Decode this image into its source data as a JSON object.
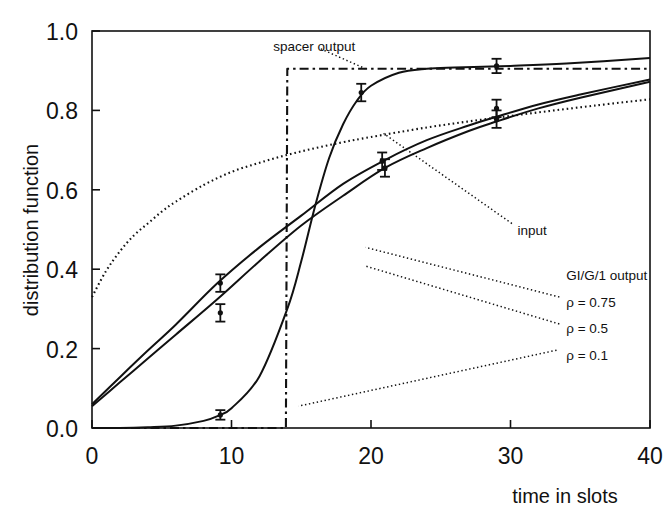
{
  "chart_data": {
    "type": "line",
    "title": "",
    "xlabel": "time in slots",
    "ylabel": "distribution function",
    "xlim": [
      0,
      40
    ],
    "ylim": [
      0.0,
      1.0
    ],
    "xticks": [
      0,
      10,
      20,
      30,
      40
    ],
    "xtick_labels": [
      "0",
      "10",
      "20",
      "30",
      "40"
    ],
    "yticks": [
      0.0,
      0.2,
      0.4,
      0.6,
      0.8,
      1.0
    ],
    "ytick_labels": [
      "0.0",
      "0.2",
      "0.4",
      "0.6",
      "0.8",
      "1.0"
    ],
    "grid": false,
    "legend_position": "inside-annotations",
    "series": [
      {
        "name": "input",
        "style": "dotted",
        "annotation": "input",
        "x": [
          0,
          1,
          2,
          3,
          4,
          5,
          6,
          8,
          10,
          12,
          14,
          16,
          18,
          20,
          24,
          28,
          32,
          36,
          40
        ],
        "y": [
          0.33,
          0.395,
          0.445,
          0.485,
          0.515,
          0.545,
          0.57,
          0.612,
          0.645,
          0.668,
          0.688,
          0.705,
          0.72,
          0.733,
          0.757,
          0.777,
          0.795,
          0.812,
          0.828
        ]
      },
      {
        "name": "spacer output",
        "style": "dash-dot",
        "annotation": "spacer output",
        "x": [
          0,
          13.9,
          14.0,
          14.1,
          40
        ],
        "y": [
          0.0,
          0.0,
          0.905,
          0.905,
          0.905
        ]
      },
      {
        "name": "GI/G/1 output rho = 0.1",
        "label": "ρ = 0.1",
        "style": "solid",
        "x": [
          0,
          2,
          4,
          6,
          8,
          9,
          10,
          12,
          14,
          15,
          16,
          17,
          18,
          19,
          20,
          22,
          24,
          26,
          28,
          30,
          34,
          40
        ],
        "y": [
          0.0,
          0.0,
          0.002,
          0.006,
          0.018,
          0.03,
          0.05,
          0.13,
          0.3,
          0.42,
          0.56,
          0.68,
          0.765,
          0.825,
          0.862,
          0.895,
          0.905,
          0.908,
          0.91,
          0.912,
          0.918,
          0.932
        ]
      },
      {
        "name": "GI/G/1 output rho = 0.5",
        "label": "ρ = 0.5",
        "style": "solid",
        "x": [
          0,
          2,
          4,
          6,
          9,
          12,
          15,
          18,
          21,
          24,
          27,
          29,
          32,
          35,
          40
        ],
        "y": [
          0.055,
          0.115,
          0.175,
          0.235,
          0.325,
          0.42,
          0.51,
          0.585,
          0.655,
          0.705,
          0.748,
          0.772,
          0.805,
          0.832,
          0.872
        ]
      },
      {
        "name": "GI/G/1 output rho = 0.75",
        "label": "ρ = 0.75",
        "style": "solid",
        "x": [
          0,
          2,
          4,
          6,
          9,
          12,
          15,
          18,
          21,
          24,
          27,
          29,
          32,
          35,
          40
        ],
        "y": [
          0.06,
          0.128,
          0.195,
          0.26,
          0.365,
          0.455,
          0.535,
          0.615,
          0.675,
          0.725,
          0.762,
          0.784,
          0.815,
          0.84,
          0.878
        ]
      }
    ],
    "error_bars": [
      {
        "series": "GI/G/1 output rho = 0.75",
        "x": 9.2,
        "y": 0.365,
        "err": 0.022
      },
      {
        "series": "GI/G/1 output rho = 0.5",
        "x": 9.2,
        "y": 0.29,
        "err": 0.022
      },
      {
        "series": "GI/G/1 output rho = 0.1",
        "x": 9.2,
        "y": 0.033,
        "err": 0.012
      },
      {
        "series": "GI/G/1 output rho = 0.1",
        "x": 19.3,
        "y": 0.845,
        "err": 0.022
      },
      {
        "series": "GI/G/1 output rho = 0.75",
        "x": 20.8,
        "y": 0.672,
        "err": 0.022
      },
      {
        "series": "GI/G/1 output rho = 0.5",
        "x": 21.0,
        "y": 0.655,
        "err": 0.022
      },
      {
        "series": "GI/G/1 output rho = 0.1",
        "x": 29.0,
        "y": 0.912,
        "err": 0.018
      },
      {
        "series": "GI/G/1 output rho = 0.75",
        "x": 29.0,
        "y": 0.805,
        "err": 0.022
      },
      {
        "series": "GI/G/1 output rho = 0.5",
        "x": 29.0,
        "y": 0.778,
        "err": 0.022
      }
    ],
    "annotations": [
      {
        "name": "spacer-output",
        "text": "spacer output",
        "x": 13.0,
        "y": 0.962,
        "leader": [
          [
            16.4,
            0.955
          ],
          [
            19.6,
            0.905
          ]
        ]
      },
      {
        "name": "input",
        "text": "input",
        "x": 30.5,
        "y": 0.5,
        "leader": [
          [
            30.1,
            0.515
          ],
          [
            20.9,
            0.742
          ]
        ]
      },
      {
        "name": "gig1-output-header",
        "text": "GI/G/1 output",
        "x": 34.0,
        "y": 0.385
      },
      {
        "name": "rho-075",
        "text": "ρ = 0.75",
        "x": 34.0,
        "y": 0.318,
        "leader": [
          [
            33.5,
            0.33
          ],
          [
            19.6,
            0.455
          ]
        ]
      },
      {
        "name": "rho-05",
        "text": "ρ = 0.5",
        "x": 34.0,
        "y": 0.252,
        "leader": [
          [
            33.5,
            0.262
          ],
          [
            19.6,
            0.408
          ]
        ]
      },
      {
        "name": "rho-01",
        "text": "ρ = 0.1",
        "x": 34.0,
        "y": 0.185,
        "leader": [
          [
            33.3,
            0.196
          ],
          [
            14.8,
            0.055
          ]
        ]
      }
    ]
  },
  "axis": {
    "ylabel": "distribution function",
    "xlabel": "time in slots"
  }
}
